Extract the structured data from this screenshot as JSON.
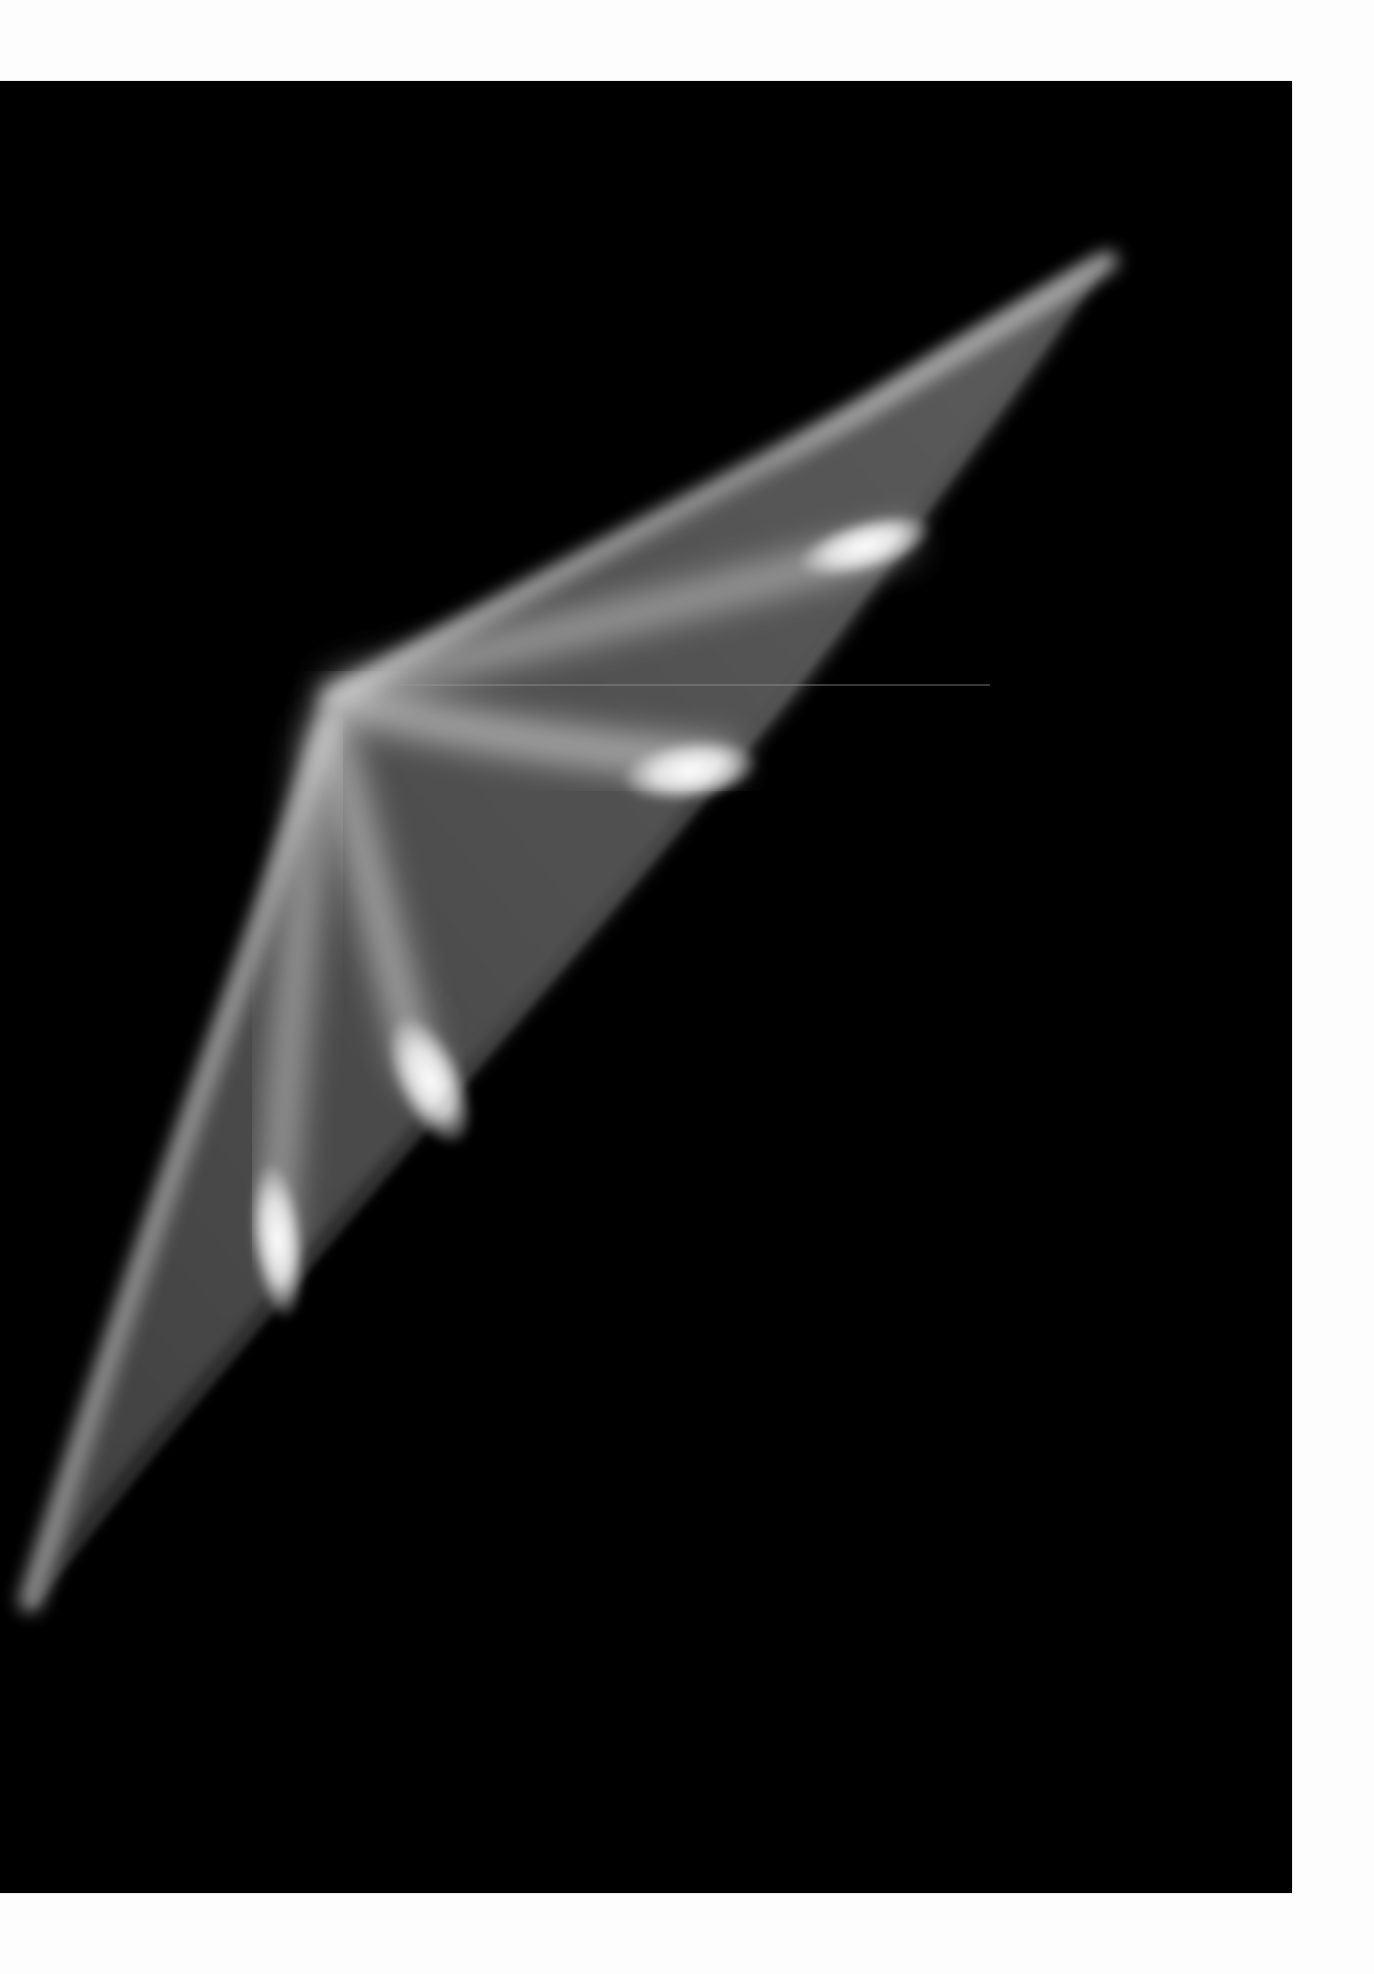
{
  "image": {
    "subject": "light-streak-photograph",
    "background_color": "#000000",
    "margin_color": "#fdfdfd",
    "highlight_color": "#ffffff",
    "glow_color": "#bdbdbd"
  }
}
